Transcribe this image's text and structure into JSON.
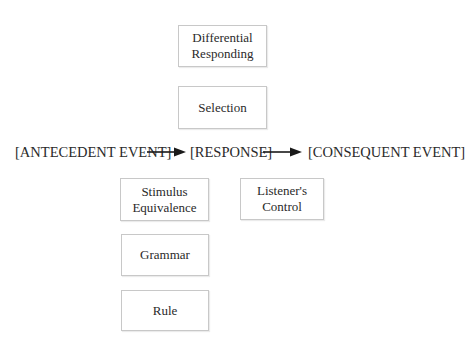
{
  "boxes": {
    "differential_responding": "Differential\nResponding",
    "selection": "Selection",
    "stimulus_equivalence": "Stimulus\nEquivalence",
    "listeners_control": "Listener's\nControl",
    "grammar": "Grammar",
    "rule": "Rule"
  },
  "chain": {
    "antecedent": "[ANTECEDENT EVENT]",
    "response": "[RESPONSE]",
    "consequent": "[CONSEQUENT EVENT]"
  }
}
